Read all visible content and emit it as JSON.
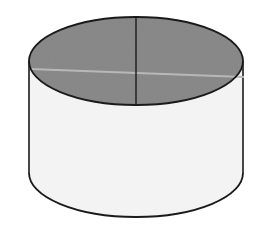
{
  "diagram": {
    "type": "cylinder",
    "colors": {
      "background": "#ffffff",
      "top_face": "#8a8a8a",
      "side_face": "#f2f2f2",
      "outline": "#1a1a1a",
      "horizontal_line": "#b4b4b4"
    },
    "geometry": {
      "cx": 136,
      "top_cy": 61,
      "bottom_cy": 173,
      "rx": 107,
      "ry": 44
    }
  }
}
